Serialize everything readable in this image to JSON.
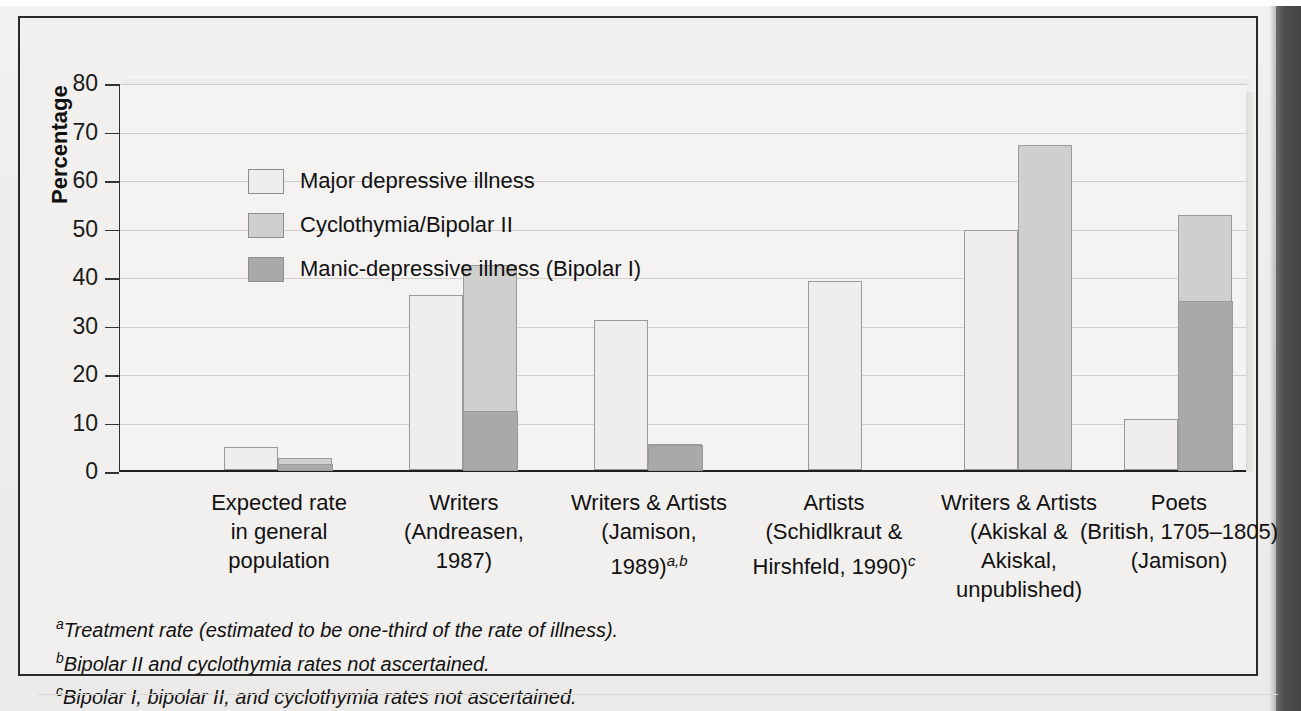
{
  "chart_data": {
    "type": "bar",
    "subtype": "grouped-stacked",
    "title": "",
    "xlabel": "",
    "ylabel": "Percentage",
    "ylim": [
      0,
      80
    ],
    "ytick_step": 10,
    "yticks": [
      "80",
      "70",
      "60",
      "50",
      "40",
      "30",
      "20",
      "10",
      "0"
    ],
    "grid": "horizontal",
    "legend_position": "inside-top-left",
    "legend": [
      {
        "label": "Major depressive illness",
        "color": "#efeeec"
      },
      {
        "label": "Cyclothymia/Bipolar II",
        "color": "#cfcfcd"
      },
      {
        "label": "Manic-depressive illness (Bipolar I)",
        "color": "#a9a9a7"
      }
    ],
    "series": [
      {
        "name": "Major depressive illness",
        "values": [
          4.8,
          36.0,
          31.0,
          39.0,
          49.5,
          10.5
        ]
      },
      {
        "name": "Cyclothymia/Bipolar II",
        "values": [
          1.2,
          30.0,
          0,
          0,
          67.0,
          17.5
        ]
      },
      {
        "name": "Manic-depressive illness (Bipolar I)",
        "values": [
          1.3,
          12.3,
          5.3,
          0,
          0,
          35.0
        ]
      }
    ],
    "stacked_bar_totals": [
      2.5,
      42.3,
      5.3,
      null,
      67.0,
      52.5
    ],
    "categories": [
      {
        "lines": [
          "Expected rate",
          "in general",
          "population"
        ],
        "sup": ""
      },
      {
        "lines": [
          "Writers",
          "(Andreasen,",
          "1987)"
        ],
        "sup": ""
      },
      {
        "lines": [
          "Writers & Artists",
          "(Jamison,",
          "1989)"
        ],
        "sup": "a,b"
      },
      {
        "lines": [
          "Artists",
          "(Schidlkraut &",
          "Hirshfeld, 1990)"
        ],
        "sup": "c"
      },
      {
        "lines": [
          "Writers & Artists",
          "(Akiskal &",
          "Akiskal,",
          "unpublished)"
        ],
        "sup": ""
      },
      {
        "lines": [
          "Poets",
          "(British, 1705–1805)",
          "(Jamison)"
        ],
        "sup": ""
      }
    ]
  },
  "footnotes": [
    {
      "marker": "a",
      "text": "Treatment rate (estimated to be one-third of the rate of illness)."
    },
    {
      "marker": "b",
      "text": "Bipolar II and cyclothymia rates not ascertained."
    },
    {
      "marker": "c",
      "text": "Bipolar I, bipolar II, and cyclothymia rates not ascertained."
    }
  ],
  "colors": {
    "major_depressive": "#efeeec",
    "cyclothymia_bipolar2": "#cfcfcd",
    "manic_depressive_bipolar1": "#a9a9a7",
    "bar_outline": "#9a9a9a",
    "plot_background": "#f4f3f1",
    "page_background": "#f1f0ee",
    "axis": "#1f1f1f",
    "gridline": "#cfcecb",
    "book_edge": "#4e4d4b"
  }
}
